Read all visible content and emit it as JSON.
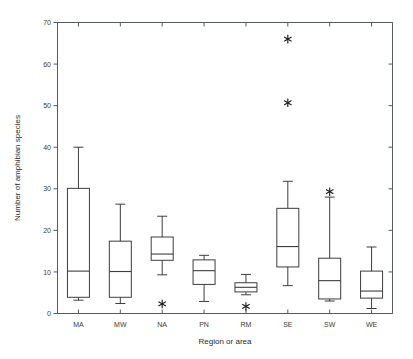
{
  "chart_data": {
    "type": "box",
    "title": "",
    "xlabel": "Region or area",
    "ylabel": "Number of amphibian species",
    "categories": [
      "MA",
      "MW",
      "NA",
      "PN",
      "RM",
      "SE",
      "SW",
      "WE"
    ],
    "ylim": [
      0,
      70
    ],
    "yticks": [
      0,
      10,
      20,
      30,
      40,
      50,
      60,
      70
    ],
    "ytick_labels": [
      "0",
      "10",
      "20",
      "30",
      "40",
      "50",
      "60",
      "70"
    ],
    "grid": false,
    "legend": "none",
    "boxes": [
      {
        "category": "MA",
        "whisker_low": 3.2,
        "q1": 3.9,
        "median": 10.2,
        "q3": 30.1,
        "whisker_high": 40.0,
        "outliers": []
      },
      {
        "category": "MW",
        "whisker_low": 2.4,
        "q1": 3.9,
        "median": 10.1,
        "q3": 17.4,
        "whisker_high": 26.3,
        "outliers": []
      },
      {
        "category": "NA",
        "whisker_low": 9.3,
        "q1": 12.8,
        "median": 14.3,
        "q3": 18.4,
        "whisker_high": 23.4,
        "outliers": [
          2.3
        ]
      },
      {
        "category": "PN",
        "whisker_low": 2.9,
        "q1": 7.0,
        "median": 10.3,
        "q3": 12.9,
        "whisker_high": 14.0,
        "outliers": []
      },
      {
        "category": "RM",
        "whisker_low": 4.5,
        "q1": 5.2,
        "median": 6.3,
        "q3": 7.4,
        "whisker_high": 9.4,
        "outliers": [
          1.7
        ]
      },
      {
        "category": "SE",
        "whisker_low": 6.7,
        "q1": 11.2,
        "median": 16.1,
        "q3": 25.3,
        "whisker_high": 31.8,
        "outliers": [
          50.7,
          66.0
        ]
      },
      {
        "category": "SW",
        "whisker_low": 3.0,
        "q1": 3.5,
        "median": 7.9,
        "q3": 13.3,
        "whisker_high": 28.0,
        "outliers": [
          29.3
        ]
      },
      {
        "category": "WE",
        "whisker_low": 1.2,
        "q1": 3.7,
        "median": 5.4,
        "q3": 10.2,
        "whisker_high": 16.0,
        "outliers": []
      }
    ]
  },
  "colors": {
    "axis": "#555a5e",
    "box_stroke": "#3d3d3d",
    "outlier": "#1c1c1c",
    "background": "#ffffff",
    "text": "#2b2b2b"
  }
}
